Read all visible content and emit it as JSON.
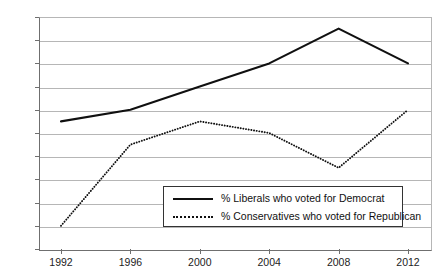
{
  "chart_data": {
    "type": "line",
    "title": "",
    "xlabel": "",
    "ylabel": "",
    "categories": [
      "1992",
      "1996",
      "2000",
      "2004",
      "2008",
      "2012"
    ],
    "x": [
      1992,
      1996,
      2000,
      2004,
      2008,
      2012
    ],
    "ylim": [
      70,
      90
    ],
    "ytick_step": 2,
    "ytick_labels": [
      "90%",
      "88%",
      "86%",
      "84%",
      "82%",
      "80%",
      "78%",
      "76%",
      "74%",
      "72%",
      "70%"
    ],
    "ytick_values": [
      90,
      88,
      86,
      84,
      82,
      80,
      78,
      76,
      74,
      72,
      70
    ],
    "grid": true,
    "grid_axis": "y",
    "legend_position": "inside-bottom-center",
    "series": [
      {
        "name": "% Liberals who voted for Democrat",
        "style": "solid",
        "color": "#101010",
        "values": [
          81,
          82,
          84,
          86,
          89,
          86
        ]
      },
      {
        "name": "% Conservatives who voted for Republican",
        "style": "dotted",
        "color": "#101010",
        "values": [
          72,
          79,
          81,
          80,
          77,
          82
        ]
      }
    ]
  },
  "legend": {
    "entries": [
      {
        "label": "% Liberals who voted for Democrat",
        "style": "solid"
      },
      {
        "label": "% Conservatives who voted for Republican",
        "style": "dotted"
      }
    ]
  }
}
